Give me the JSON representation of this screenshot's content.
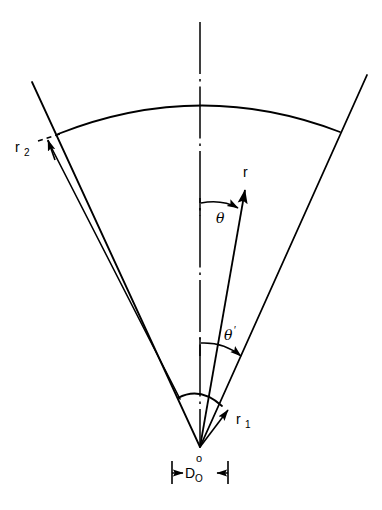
{
  "figure": {
    "background_color": "#ffffff",
    "line_color": "#000000",
    "width": 382,
    "height": 510
  },
  "labels": {
    "r_outer": "r",
    "r_outer_sub": "2",
    "r_inner": "r",
    "r_inner_sub": "1",
    "radius_vector": "r",
    "theta": "θ",
    "theta_prime": "θ",
    "theta_prime_mark": "′",
    "origin": "o",
    "diameter": "D",
    "diameter_sub": "O"
  },
  "geometry": {
    "apex": {
      "x": 200,
      "y": 447
    },
    "centerline": {
      "x": 200,
      "y_top": 22,
      "y_bottom": 447
    },
    "outer_arc": {
      "left_x": 58,
      "left_y": 134,
      "top_x": 200,
      "top_y": 100,
      "right_x": 340,
      "right_y": 132
    },
    "inner_arc": {
      "left_x": 178,
      "left_y": 398,
      "right_x": 222,
      "right_y": 406
    },
    "left_boundary": {
      "x1": 32,
      "y1": 82,
      "x2": 200,
      "y2": 447
    },
    "right_boundary": {
      "x1": 367,
      "y1": 75,
      "x2": 200,
      "y2": 447
    },
    "r_vector": {
      "tip_x": 246,
      "tip_y": 189
    },
    "theta_arc_y": 203,
    "theta_prime_arc_y": 343,
    "dimension_line_y": 470,
    "dimension_left_x": 172,
    "dimension_right_x": 228
  }
}
